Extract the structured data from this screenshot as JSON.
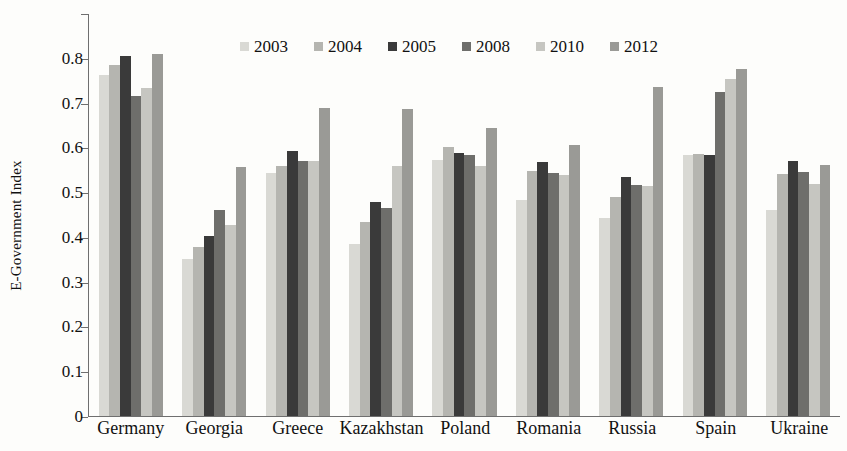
{
  "chart_data": {
    "type": "bar",
    "title": "",
    "xlabel": "",
    "ylabel": "E-Government Index",
    "ylim": [
      0,
      0.9
    ],
    "ytick_labels": [
      "0",
      "0.1",
      "0.2",
      "0.3",
      "0.4",
      "0.5",
      "0.6",
      "0.7",
      "0.8"
    ],
    "ytick_values": [
      0,
      0.1,
      0.2,
      0.3,
      0.4,
      0.5,
      0.6,
      0.7,
      0.8
    ],
    "grid": false,
    "legend_position": "top-center",
    "categories": [
      "Germany",
      "Georgia",
      "Greece",
      "Kazakhstan",
      "Poland",
      "Romania",
      "Russia",
      "Spain",
      "Ukraine"
    ],
    "series": [
      {
        "name": "2003",
        "color": "#d9d9d4",
        "values": [
          0.762,
          0.35,
          0.543,
          0.385,
          0.572,
          0.483,
          0.443,
          0.582,
          0.461
        ]
      },
      {
        "name": "2004",
        "color": "#b5b5b0",
        "values": [
          0.785,
          0.378,
          0.558,
          0.433,
          0.6,
          0.548,
          0.49,
          0.585,
          0.54
        ]
      },
      {
        "name": "2005",
        "color": "#3a3a3a",
        "values": [
          0.805,
          0.403,
          0.592,
          0.478,
          0.588,
          0.568,
          0.533,
          0.583,
          0.57
        ]
      },
      {
        "name": "2008",
        "color": "#6e6e6b",
        "values": [
          0.715,
          0.46,
          0.57,
          0.465,
          0.582,
          0.543,
          0.517,
          0.723,
          0.546
        ]
      },
      {
        "name": "2010",
        "color": "#c6c6c1",
        "values": [
          0.732,
          0.427,
          0.57,
          0.558,
          0.558,
          0.538,
          0.513,
          0.752,
          0.518
        ]
      },
      {
        "name": "2012",
        "color": "#9a9a96",
        "values": [
          0.808,
          0.555,
          0.687,
          0.685,
          0.643,
          0.605,
          0.735,
          0.775,
          0.56
        ]
      }
    ]
  }
}
